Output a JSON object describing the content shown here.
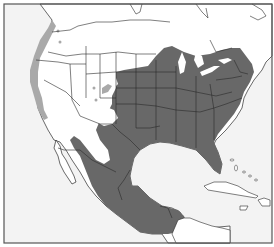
{
  "map": {
    "title": "",
    "region": "North America (USA, Mexico, Central America, Caribbean)",
    "colors": {
      "ocean": "#f3f3f3",
      "land": "#ffffff",
      "border": "#2a2a2a",
      "frame": "#555555",
      "range_primary": "#686868",
      "range_secondary": "#a9a9a9"
    },
    "legend": []
  }
}
